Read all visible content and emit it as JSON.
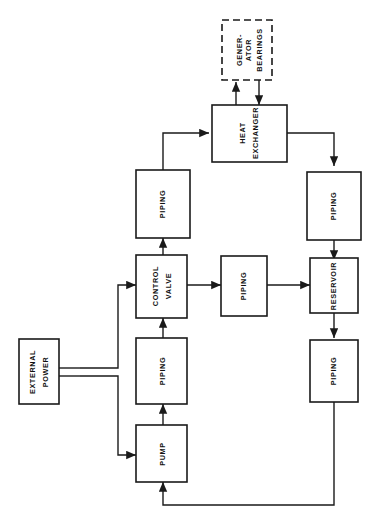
{
  "diagram": {
    "orientation": "rotated-90",
    "background_color": "#ffffff",
    "line_color": "#1a1a1a",
    "nodes": {
      "generator_bearings": {
        "line1": "GENER-",
        "line2": "ATOR",
        "line3": "BEARINGS",
        "style": "dashed"
      },
      "heat_exchanger": {
        "line1": "HEAT",
        "line2": "EXCHANGER",
        "style": "solid"
      },
      "piping_upper_left": {
        "line1": "PIPING",
        "style": "solid"
      },
      "piping_upper_right": {
        "line1": "PIPING",
        "style": "solid"
      },
      "control_valve": {
        "line1": "CONTROL",
        "line2": "VALVE",
        "style": "solid"
      },
      "piping_middle": {
        "line1": "PIPING",
        "style": "solid"
      },
      "reservoir": {
        "line1": "RESERVOIR",
        "style": "solid"
      },
      "external_power": {
        "line1": "EXTERNAL",
        "line2": "POWER",
        "style": "solid"
      },
      "piping_lower_left": {
        "line1": "PIPING",
        "style": "solid"
      },
      "piping_lower_right": {
        "line1": "PIPING",
        "style": "solid"
      },
      "pump": {
        "line1": "PUMP",
        "style": "solid"
      }
    },
    "connections": [
      {
        "from": "heat_exchanger",
        "to": "generator_bearings",
        "type": "arrow-up"
      },
      {
        "from": "generator_bearings",
        "to": "heat_exchanger",
        "type": "arrow-down"
      },
      {
        "from": "piping_upper_left",
        "to": "heat_exchanger",
        "type": "arrow"
      },
      {
        "from": "heat_exchanger",
        "to": "piping_upper_right",
        "type": "arrow"
      },
      {
        "from": "piping_upper_right",
        "to": "reservoir",
        "type": "arrow"
      },
      {
        "from": "control_valve",
        "to": "piping_upper_left",
        "type": "arrow"
      },
      {
        "from": "control_valve",
        "to": "piping_middle",
        "type": "arrow"
      },
      {
        "from": "piping_middle",
        "to": "reservoir",
        "type": "arrow"
      },
      {
        "from": "reservoir",
        "to": "piping_lower_right",
        "type": "arrow"
      },
      {
        "from": "piping_lower_right",
        "to": "pump",
        "type": "arrow-return"
      },
      {
        "from": "pump",
        "to": "piping_lower_left",
        "type": "arrow"
      },
      {
        "from": "piping_lower_left",
        "to": "control_valve",
        "type": "arrow"
      },
      {
        "from": "external_power",
        "to": "control_valve",
        "type": "power-arrow"
      },
      {
        "from": "external_power",
        "to": "pump",
        "type": "power-arrow"
      }
    ]
  }
}
